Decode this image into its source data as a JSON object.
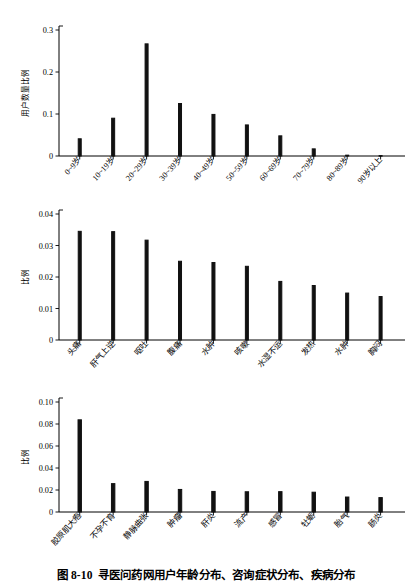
{
  "caption": {
    "number": "图 8-10",
    "text": "寻医问药网用户年龄分布、咨询症状分布、疾病分布"
  },
  "chart_data": [
    {
      "type": "bar",
      "name": "age-distribution",
      "title": "",
      "xlabel": "",
      "ylabel": "用户数量比例",
      "ylim": [
        0,
        0.3
      ],
      "ytick_labels": [
        "0",
        "0.1",
        "0.2",
        "0.3"
      ],
      "ytick_values": [
        0,
        0.1,
        0.2,
        0.3
      ],
      "grid": false,
      "legend": "none",
      "categories": [
        "0~9岁",
        "10~19岁",
        "20~29岁",
        "30~39岁",
        "40~49岁",
        "50~59岁",
        "60~69岁",
        "70~79岁",
        "80~89岁",
        "90岁以上"
      ],
      "values": [
        0.041,
        0.09,
        0.267,
        0.125,
        0.099,
        0.074,
        0.048,
        0.017,
        0.002,
        0.001
      ]
    },
    {
      "type": "bar",
      "name": "symptom-distribution",
      "title": "",
      "xlabel": "",
      "ylabel": "比例",
      "ylim": [
        0,
        0.04
      ],
      "ytick_labels": [
        "0",
        "0.01",
        "0.02",
        "0.03",
        "0.04"
      ],
      "ytick_values": [
        0,
        0.01,
        0.02,
        0.03,
        0.04
      ],
      "grid": false,
      "legend": "none",
      "categories": [
        "头痛",
        "肝气上逆",
        "呕吐",
        "腹痛",
        "水肿",
        "咳嗽",
        "水湿不运",
        "发热",
        "水肿",
        "胸闷"
      ],
      "values": [
        0.0345,
        0.0344,
        0.0317,
        0.025,
        0.0246,
        0.0234,
        0.0186,
        0.0173,
        0.0149,
        0.0138
      ]
    },
    {
      "type": "bar",
      "name": "disease-distribution",
      "title": "",
      "xlabel": "",
      "ylabel": "比例",
      "ylim": [
        0,
        0.1
      ],
      "ytick_labels": [
        "0",
        "0.02",
        "0.04",
        "0.06",
        "0.08",
        "0.10"
      ],
      "ytick_values": [
        0,
        0.02,
        0.04,
        0.06,
        0.08,
        0.1
      ],
      "grid": false,
      "legend": "none",
      "categories": [
        "胶原肌大疱",
        "不孕不育",
        "静脉曲张",
        "肿瘤",
        "肝炎",
        "流产",
        "感冒",
        "牡蛎",
        "胎气",
        "肠炎"
      ],
      "values": [
        0.0838,
        0.0258,
        0.0278,
        0.0205,
        0.0187,
        0.0184,
        0.0185,
        0.018,
        0.0136,
        0.0131
      ]
    }
  ]
}
